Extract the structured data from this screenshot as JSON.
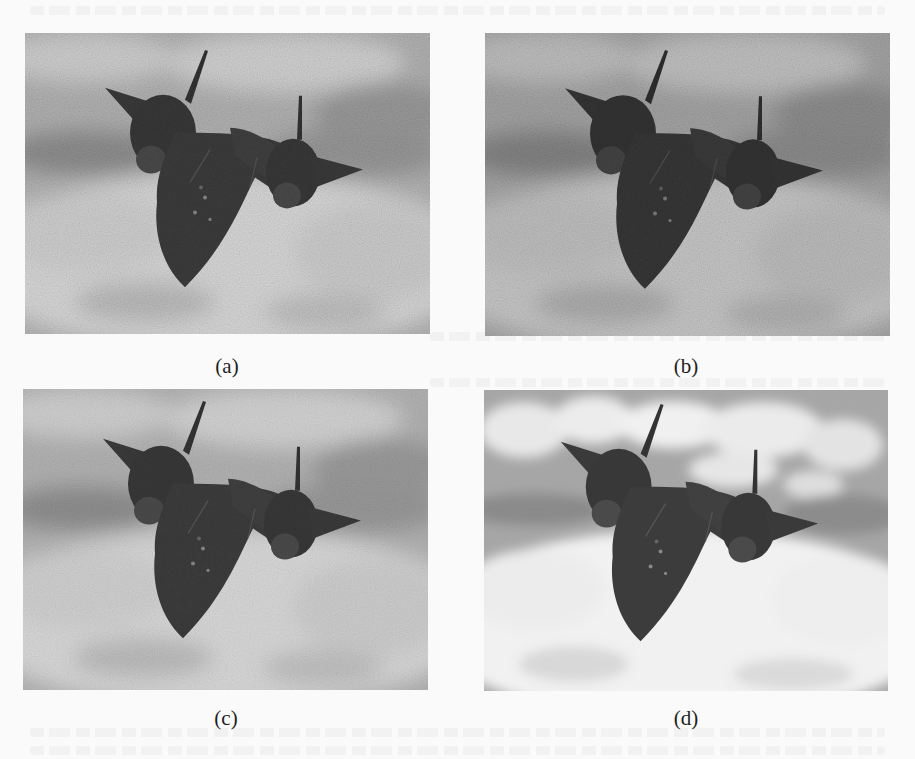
{
  "figure": {
    "panels": [
      {
        "id": "a",
        "label": "(a)",
        "description": "Aircraft over clouds with heavy noise",
        "noise_level": "high"
      },
      {
        "id": "b",
        "label": "(b)",
        "description": "Aircraft over clouds with heavy noise, darker tone",
        "noise_level": "high"
      },
      {
        "id": "c",
        "label": "(c)",
        "description": "Aircraft over clouds, partially denoised",
        "noise_level": "medium"
      },
      {
        "id": "d",
        "label": "(d)",
        "description": "Aircraft over clouds, denoised/clean",
        "noise_level": "low"
      }
    ]
  },
  "colors": {
    "page_background": "#fafafa",
    "sky_dark": "#8a8a8a",
    "sky_mid": "#a8a8a8",
    "cloud_light": "#d6d6d6",
    "aircraft": "#3c3c3c",
    "caption_text": "#1e1e1e"
  }
}
